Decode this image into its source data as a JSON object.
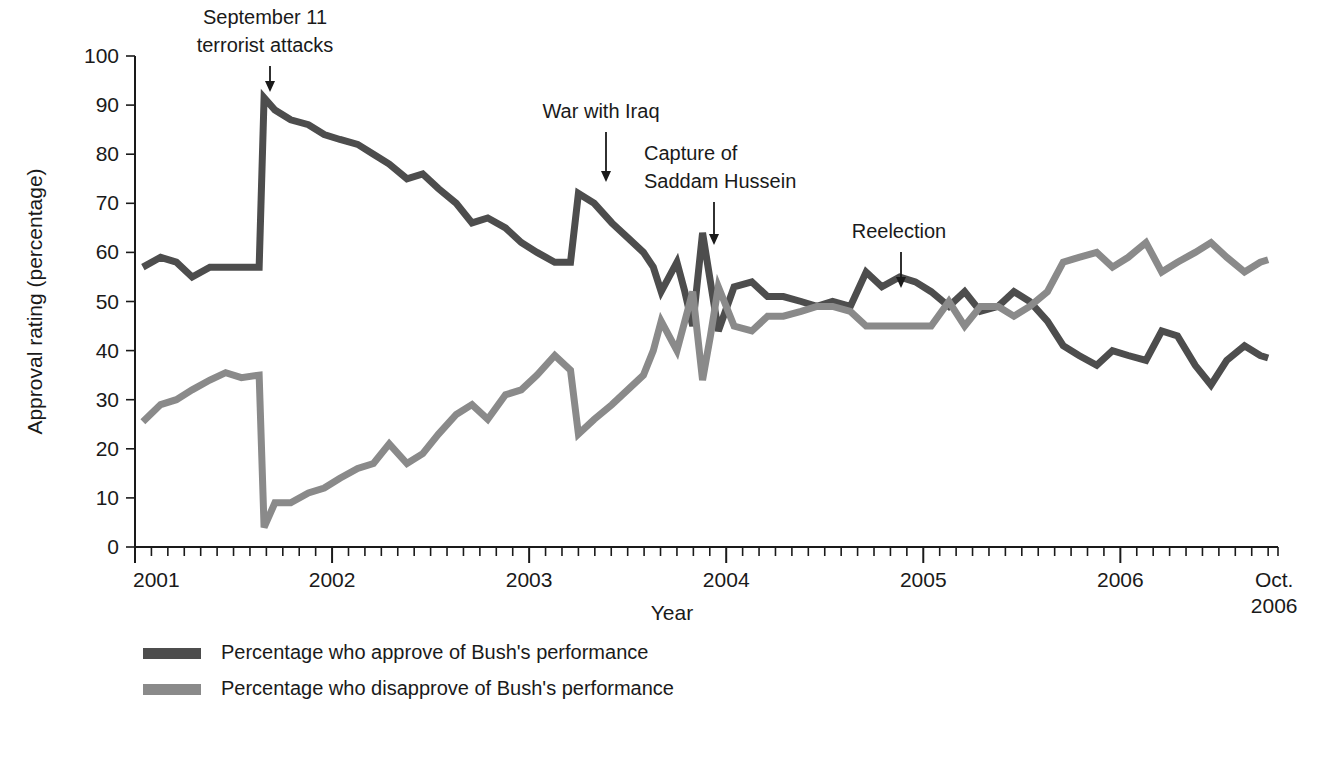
{
  "chart_data": {
    "type": "line",
    "title": "",
    "xlabel": "Year",
    "ylabel": "Approval rating (percentage)",
    "ylim": [
      0,
      100
    ],
    "ytick_labels": [
      "0",
      "10",
      "20",
      "30",
      "40",
      "50",
      "60",
      "70",
      "80",
      "90",
      "100"
    ],
    "ytick_values": [
      0,
      10,
      20,
      30,
      40,
      50,
      60,
      70,
      80,
      90,
      100
    ],
    "xtick_labels": [
      "2001",
      "2002",
      "2003",
      "2004",
      "2005",
      "2006",
      "Oct."
    ],
    "xtick_label_last_line2": "2006",
    "xtick_values": [
      2001.0,
      2002.0,
      2003.0,
      2004.0,
      2005.0,
      2006.0,
      2006.75
    ],
    "xlim": [
      2001.0,
      2006.8
    ],
    "grid": false,
    "minor_ticks": "monthly",
    "legend_position": "below-left",
    "series": [
      {
        "name": "Percentage who approve of Bush's performance",
        "color": "#4d4d4d",
        "x": [
          2001.04,
          2001.13,
          2001.21,
          2001.29,
          2001.38,
          2001.46,
          2001.54,
          2001.63,
          2001.655,
          2001.71,
          2001.79,
          2001.88,
          2001.96,
          2002.04,
          2002.13,
          2002.21,
          2002.29,
          2002.38,
          2002.46,
          2002.54,
          2002.63,
          2002.71,
          2002.79,
          2002.88,
          2002.96,
          2003.04,
          2003.13,
          2003.21,
          2003.25,
          2003.33,
          2003.42,
          2003.5,
          2003.58,
          2003.63,
          2003.67,
          2003.75,
          2003.79,
          2003.83,
          2003.88,
          2003.92,
          2003.96,
          2004.04,
          2004.13,
          2004.21,
          2004.29,
          2004.38,
          2004.46,
          2004.54,
          2004.63,
          2004.71,
          2004.79,
          2004.88,
          2004.96,
          2005.04,
          2005.13,
          2005.21,
          2005.29,
          2005.38,
          2005.46,
          2005.54,
          2005.63,
          2005.71,
          2005.79,
          2005.88,
          2005.96,
          2006.04,
          2006.13,
          2006.21,
          2006.29,
          2006.38,
          2006.46,
          2006.54,
          2006.63,
          2006.71,
          2006.75
        ],
        "values": [
          57,
          59,
          58,
          55,
          57,
          57,
          57,
          57,
          91.5,
          89,
          87,
          86,
          84,
          83,
          82,
          80,
          78,
          75,
          76,
          73,
          70,
          66,
          67,
          65,
          62,
          60,
          58,
          58,
          72,
          70,
          66,
          63,
          60,
          57,
          52,
          58,
          52,
          45,
          64,
          54,
          44,
          53,
          54,
          51,
          51,
          50,
          49,
          50,
          49,
          56,
          53,
          55,
          54,
          52,
          49,
          52,
          48,
          49,
          52,
          50,
          46,
          41,
          39,
          37,
          40,
          39,
          38,
          44,
          43,
          37,
          33,
          38,
          41,
          39,
          38.5
        ]
      },
      {
        "name": "Percentage who disapprove of Bush's performance",
        "color": "#8a8a8a",
        "x": [
          2001.04,
          2001.13,
          2001.21,
          2001.29,
          2001.38,
          2001.46,
          2001.54,
          2001.63,
          2001.655,
          2001.71,
          2001.79,
          2001.88,
          2001.96,
          2002.04,
          2002.13,
          2002.21,
          2002.29,
          2002.38,
          2002.46,
          2002.54,
          2002.63,
          2002.71,
          2002.79,
          2002.88,
          2002.96,
          2003.04,
          2003.13,
          2003.21,
          2003.25,
          2003.33,
          2003.42,
          2003.5,
          2003.58,
          2003.63,
          2003.67,
          2003.75,
          2003.79,
          2003.83,
          2003.88,
          2003.92,
          2003.96,
          2004.04,
          2004.13,
          2004.21,
          2004.29,
          2004.38,
          2004.46,
          2004.54,
          2004.63,
          2004.71,
          2004.79,
          2004.88,
          2004.96,
          2005.04,
          2005.13,
          2005.21,
          2005.29,
          2005.38,
          2005.46,
          2005.54,
          2005.63,
          2005.71,
          2005.79,
          2005.88,
          2005.96,
          2006.04,
          2006.13,
          2006.21,
          2006.29,
          2006.38,
          2006.46,
          2006.54,
          2006.63,
          2006.71,
          2006.75
        ],
        "values": [
          25.5,
          29,
          30,
          32,
          34,
          35.5,
          34.5,
          35,
          4,
          9,
          9,
          11,
          12,
          14,
          16,
          17,
          21,
          17,
          19,
          23,
          27,
          29,
          26,
          31,
          32,
          35,
          39,
          36,
          23,
          26,
          29,
          32,
          35,
          40,
          46,
          40,
          46,
          52,
          34,
          43,
          53,
          45,
          44,
          47,
          47,
          48,
          49,
          49,
          48,
          45,
          45,
          45,
          45,
          45,
          50,
          45,
          49,
          49,
          47,
          49,
          52,
          58,
          59,
          60,
          57,
          59,
          62,
          56,
          58,
          60,
          62,
          59,
          56,
          58,
          58.5
        ]
      }
    ],
    "annotations": [
      {
        "label_lines": [
          "September 11",
          "terrorist attacks"
        ],
        "x": 2001.655,
        "text_anchor": "middle"
      },
      {
        "label_lines": [
          "War with Iraq"
        ],
        "x": 2003.25,
        "text_anchor": "middle"
      },
      {
        "label_lines": [
          "Capture of",
          "Saddam Hussein"
        ],
        "x": 2003.88,
        "text_anchor": "start"
      },
      {
        "label_lines": [
          "Reelection"
        ],
        "x": 2004.84,
        "text_anchor": "middle"
      }
    ]
  },
  "legend": {
    "items": [
      {
        "label": "Percentage who approve of Bush's performance",
        "color": "#4d4d4d"
      },
      {
        "label": "Percentage who disapprove of Bush's performance",
        "color": "#8a8a8a"
      }
    ]
  },
  "colors": {
    "approve": "#4d4d4d",
    "disapprove": "#8a8a8a",
    "axis": "#1a1a1a",
    "background": "#ffffff"
  }
}
